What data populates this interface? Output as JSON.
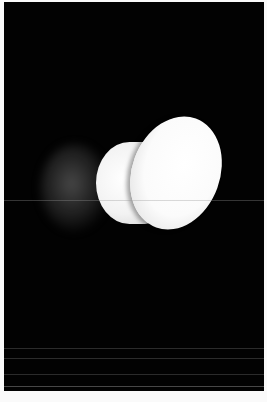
{
  "image": {
    "subject": "white mushroom-shaped wall lamp",
    "background_color": "#020202",
    "border_color": "#fafafa",
    "object_color": "#ffffff",
    "shadow_color": "#5f5f5f"
  }
}
